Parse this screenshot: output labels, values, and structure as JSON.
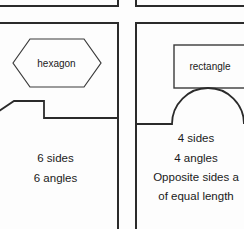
{
  "page": {
    "background_color": "#fdfdfd",
    "ink_color": "#2b2b2b"
  },
  "panels": [
    {
      "id": "hexagon-card",
      "position": "left",
      "shape_name": "hexagon",
      "shape_icon": "hexagon-outline-icon",
      "facts": [
        "6 sides",
        "6 angles"
      ]
    },
    {
      "id": "rectangle-card",
      "position": "right",
      "shape_name": "rectangle",
      "shape_icon": "rectangle-outline-icon",
      "facts": [
        "4 sides",
        "4 angles"
      ],
      "note_line_1": "Opposite sides a",
      "note_line_2": "of equal length"
    }
  ],
  "partial_shapes": [
    {
      "id": "left-bleed-polygon",
      "icon": "polygon-fragment-icon",
      "description": "partial polygon outline bleeding in from the adjacent card"
    },
    {
      "id": "right-bleed-semicircle",
      "icon": "semicircle-fragment-icon",
      "description": "partial semicircle outline bleeding in from the adjacent card"
    }
  ],
  "partial_panels": [
    {
      "id": "top-left-card-bottom",
      "description": "bottom rule of the card above on the left"
    },
    {
      "id": "top-right-card-bottom",
      "description": "bottom rule of the card above on the right"
    }
  ]
}
